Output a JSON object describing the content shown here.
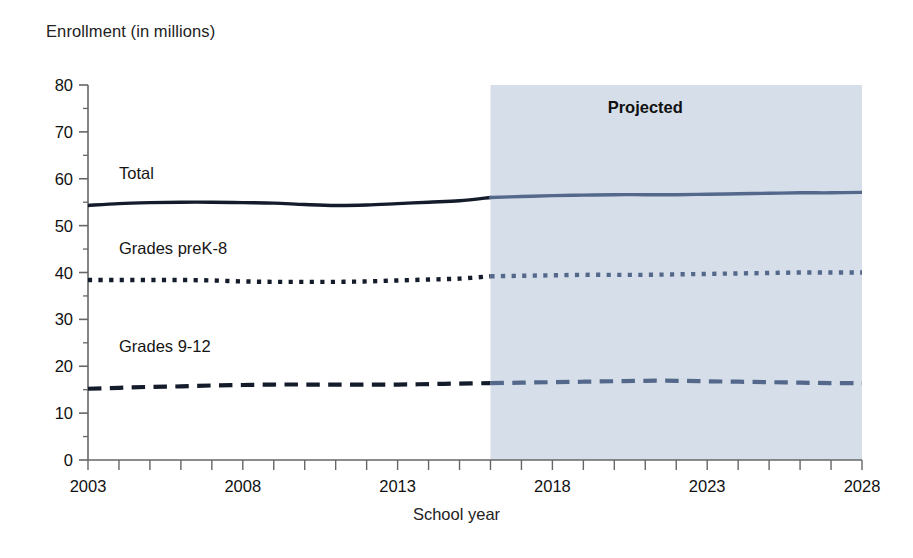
{
  "chart_data": {
    "type": "line",
    "title": "",
    "ylabel": "Enrollment (in millions)",
    "xlabel": "School year",
    "ylim": [
      0,
      80
    ],
    "xlim": [
      2003,
      2028
    ],
    "ytick_labels": [
      "0",
      "10",
      "20",
      "30",
      "40",
      "50",
      "60",
      "70",
      "80"
    ],
    "ytick_values": [
      0,
      10,
      20,
      30,
      40,
      50,
      60,
      70,
      80
    ],
    "yminor_step": 5,
    "xtick_labels": [
      "2003",
      "2008",
      "2013",
      "2018",
      "2023",
      "2028"
    ],
    "xtick_values": [
      2003,
      2008,
      2013,
      2018,
      2023,
      2028
    ],
    "xminor_step": 1,
    "grid": false,
    "legend_position": "inline-labels",
    "annotations": [
      {
        "text": "Projected",
        "x": 2021,
        "y": 74,
        "bold": true
      }
    ],
    "projection_start": 2016,
    "shaded_region": {
      "from": 2016,
      "to": 2028,
      "color": "#d6dfe9",
      "label": "Projected"
    },
    "colors": {
      "actual_line": "#141c2b",
      "projected_line": "#54688c",
      "shade": "#d6dfe9",
      "axis": "#555555"
    },
    "x": [
      2003,
      2004,
      2005,
      2006,
      2007,
      2008,
      2009,
      2010,
      2011,
      2012,
      2013,
      2014,
      2015,
      2016,
      2017,
      2018,
      2019,
      2020,
      2021,
      2022,
      2023,
      2024,
      2025,
      2026,
      2027,
      2028
    ],
    "series": [
      {
        "name": "Total",
        "style": "solid",
        "label_x": 2004,
        "label_y": 60,
        "values": [
          54.3,
          54.7,
          54.9,
          55.0,
          55.0,
          54.9,
          54.8,
          54.5,
          54.3,
          54.4,
          54.7,
          55.0,
          55.3,
          56.0,
          56.2,
          56.4,
          56.5,
          56.6,
          56.6,
          56.6,
          56.7,
          56.8,
          56.9,
          57.0,
          57.0,
          57.1
        ]
      },
      {
        "name": "Grades preK-8",
        "style": "dotted",
        "label_x": 2004,
        "label_y": 44,
        "values": [
          38.4,
          38.4,
          38.4,
          38.4,
          38.3,
          38.1,
          38.0,
          38.0,
          38.0,
          38.1,
          38.3,
          38.5,
          38.7,
          39.2,
          39.3,
          39.4,
          39.5,
          39.5,
          39.5,
          39.6,
          39.7,
          39.8,
          39.9,
          40.0,
          40.0,
          40.0
        ]
      },
      {
        "name": "Grades 9-12",
        "style": "dashed",
        "label_x": 2004,
        "label_y": 23,
        "values": [
          15.2,
          15.4,
          15.6,
          15.7,
          15.9,
          16.0,
          16.1,
          16.1,
          16.1,
          16.1,
          16.1,
          16.2,
          16.3,
          16.4,
          16.5,
          16.6,
          16.7,
          16.8,
          16.9,
          16.9,
          16.8,
          16.7,
          16.6,
          16.5,
          16.4,
          16.4
        ]
      }
    ]
  }
}
